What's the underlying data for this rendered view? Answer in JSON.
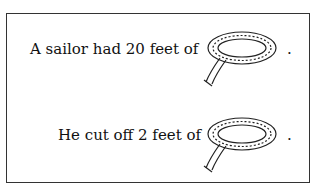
{
  "problem": {
    "lines": [
      {
        "text": "A sailor had 20 feet of",
        "icon": "rope-icon",
        "end": "."
      },
      {
        "text": "He cut off 2 feet of",
        "icon": "rope-icon",
        "end": "."
      }
    ]
  }
}
